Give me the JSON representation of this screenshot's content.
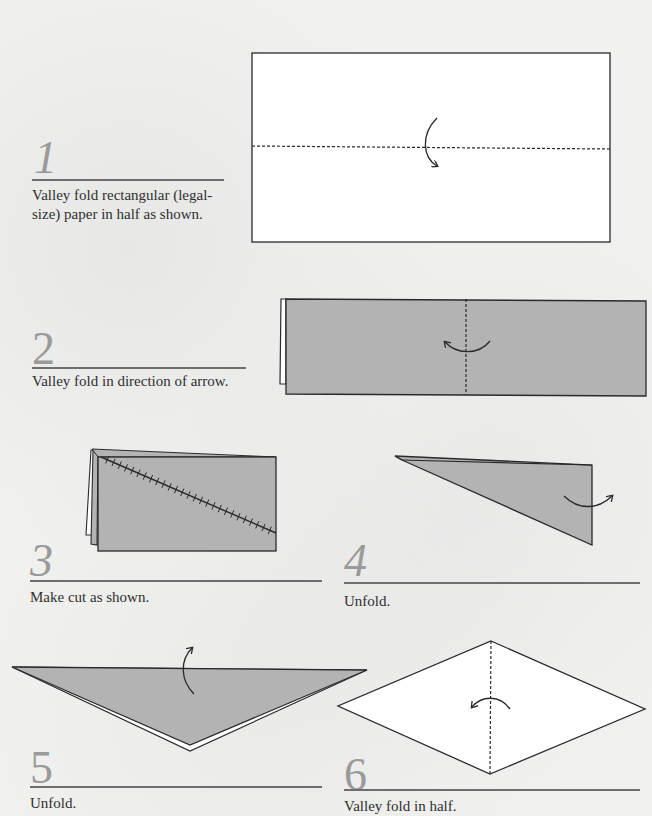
{
  "steps": [
    {
      "number": "1",
      "caption_line1": "Valley fold rectangular (legal-",
      "caption_line2": "size) paper in half as shown."
    },
    {
      "number": "2",
      "caption": "Valley fold in direction of arrow."
    },
    {
      "number": "3",
      "caption": "Make cut as shown."
    },
    {
      "number": "4",
      "caption": "Unfold."
    },
    {
      "number": "5",
      "caption": "Unfold."
    },
    {
      "number": "6",
      "caption": "Valley fold in half."
    }
  ],
  "colors": {
    "paper_colored": "#b3b3b3",
    "paper_white": "#ffffff",
    "line": "#2a2a2a",
    "step_number": "#9a9a9a",
    "rule": "#6e6e6e"
  }
}
